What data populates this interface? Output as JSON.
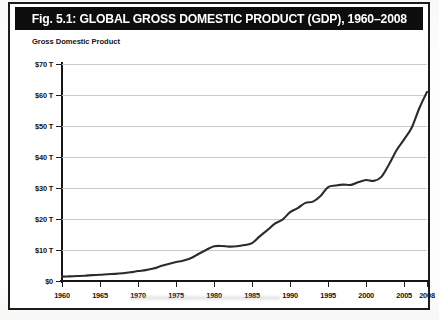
{
  "figure": {
    "title_prefix": "Fig. 5.1:",
    "title_main": "GLOBAL GROSS DOMESTIC PRODUCT (GDP), 1960–2008",
    "title_full": "Fig. 5.1: GLOBAL GROSS DOMESTIC PRODUCT (GDP), 1960–2008",
    "axis_title": "Gross Domestic Product",
    "colors": {
      "title_bar_bg": "#0d0d0d",
      "title_text": "#ffffff",
      "frame_border": "#1b1b1b",
      "gridline": "#c9c9c9",
      "series_line": "#2b2b2b",
      "plot_bg": "#ffffff"
    }
  },
  "chart_data": {
    "type": "line",
    "title": "Fig. 5.1: GLOBAL GROSS DOMESTIC PRODUCT (GDP), 1960–2008",
    "xlabel": "",
    "ylabel": "Gross Domestic Product",
    "ylim": [
      0,
      70
    ],
    "xlim": [
      1960,
      2008
    ],
    "grid": true,
    "legend": null,
    "y_unit": "trillions of US dollars",
    "y_ticks": [
      0,
      10,
      20,
      30,
      40,
      50,
      60,
      70
    ],
    "y_tick_labels": [
      "$0",
      "$10 T",
      "$20 T",
      "$30 T",
      "$40 T",
      "$50 T",
      "$60 T",
      "$70 T"
    ],
    "x_ticks": [
      1960,
      1965,
      1970,
      1975,
      1980,
      1985,
      1990,
      1995,
      2000,
      2005,
      2008
    ],
    "x_tick_labels": [
      "1960",
      "1965",
      "1970",
      "1975",
      "1980",
      "1985",
      "1990",
      "1995",
      "2000",
      "2005",
      "2008"
    ],
    "series": [
      {
        "name": "Global GDP",
        "x": [
          1960,
          1961,
          1962,
          1963,
          1964,
          1965,
          1966,
          1967,
          1968,
          1969,
          1970,
          1971,
          1972,
          1973,
          1974,
          1975,
          1976,
          1977,
          1978,
          1979,
          1980,
          1981,
          1982,
          1983,
          1984,
          1985,
          1986,
          1987,
          1988,
          1989,
          1990,
          1991,
          1992,
          1993,
          1994,
          1995,
          1996,
          1997,
          1998,
          1999,
          2000,
          2001,
          2002,
          2003,
          2004,
          2005,
          2006,
          2007,
          2008
        ],
        "values": [
          1.4,
          1.5,
          1.6,
          1.7,
          1.9,
          2.0,
          2.2,
          2.3,
          2.5,
          2.8,
          3.2,
          3.5,
          4.0,
          4.8,
          5.5,
          6.1,
          6.6,
          7.4,
          8.8,
          10.1,
          11.2,
          11.3,
          11.1,
          11.2,
          11.6,
          12.2,
          14.4,
          16.4,
          18.5,
          19.8,
          22.2,
          23.5,
          25.2,
          25.6,
          27.4,
          30.3,
          30.8,
          31.1,
          31.0,
          31.9,
          32.6,
          32.3,
          33.6,
          37.6,
          42.2,
          45.7,
          49.5,
          55.8,
          61.0
        ]
      }
    ]
  }
}
